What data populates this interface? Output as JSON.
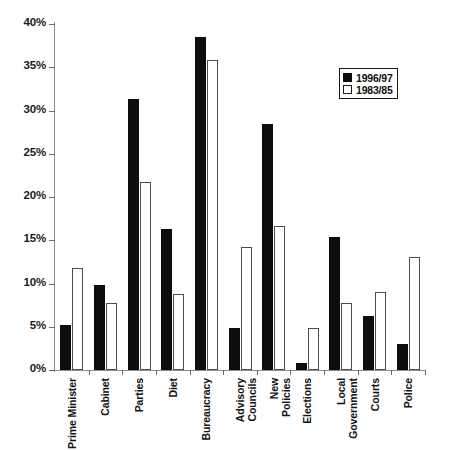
{
  "chart_data": {
    "type": "bar",
    "title": "",
    "xlabel": "",
    "ylabel": "",
    "ylim": [
      0,
      40
    ],
    "ytick_labels": [
      "0%",
      "5%",
      "10%",
      "15%",
      "20%",
      "25%",
      "30%",
      "35%",
      "40%"
    ],
    "ytick_values": [
      0,
      5,
      10,
      15,
      20,
      25,
      30,
      35,
      40
    ],
    "grid": false,
    "legend_position": "top-right",
    "categories": [
      "Prime Minister",
      "Cabinet",
      "Parties",
      "Diet",
      "Bureaucracy",
      "Advisory Councils",
      "New Policies",
      "Elections",
      "Local Government",
      "Courts",
      "Police"
    ],
    "category_lines": [
      [
        "Prime Minister"
      ],
      [
        "Cabinet"
      ],
      [
        "Parties"
      ],
      [
        "Diet"
      ],
      [
        "Bureaucracy"
      ],
      [
        "Advisory",
        "Councils"
      ],
      [
        "New",
        "Policies"
      ],
      [
        "Elections"
      ],
      [
        "Local",
        "Government"
      ],
      [
        "Courts"
      ],
      [
        "Police"
      ]
    ],
    "series": [
      {
        "name": "1996/97",
        "color": "#0d0d0d",
        "values": [
          5.2,
          9.8,
          31.3,
          16.3,
          38.5,
          4.8,
          28.4,
          0.8,
          15.4,
          6.2,
          3.0
        ]
      },
      {
        "name": "1983/85",
        "color": "#ffffff",
        "values": [
          11.8,
          7.7,
          21.7,
          8.8,
          35.8,
          14.2,
          16.7,
          4.9,
          7.8,
          9.0,
          13.1
        ]
      }
    ]
  },
  "legend": {
    "items": [
      {
        "label": "1996/97",
        "swatch": "filled-black"
      },
      {
        "label": "1983/85",
        "swatch": "outlined-white"
      }
    ]
  },
  "artifact": {
    "text": ""
  }
}
